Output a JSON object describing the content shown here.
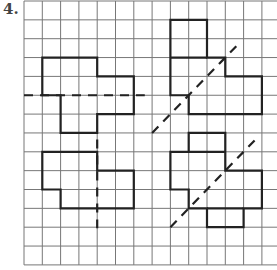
{
  "problem_number": "4.",
  "grid": {
    "origin_x": 24,
    "origin_y": 1,
    "cell_w": 18.3,
    "cell_h": 18.85,
    "cols": 14,
    "rows": 14,
    "line_color": "#777777",
    "outline_color": "#222222"
  },
  "shapes": [
    {
      "name": "shape-top-left",
      "points": [
        [
          1,
          3
        ],
        [
          4,
          3
        ],
        [
          4,
          4
        ],
        [
          6,
          4
        ],
        [
          6,
          6
        ],
        [
          4,
          6
        ],
        [
          4,
          7
        ],
        [
          2,
          7
        ],
        [
          2,
          5
        ],
        [
          1,
          5
        ]
      ],
      "internal": []
    },
    {
      "name": "shape-top-right",
      "points": [
        [
          8,
          1
        ],
        [
          10,
          1
        ],
        [
          10,
          3
        ],
        [
          11,
          3
        ],
        [
          11,
          4
        ],
        [
          13,
          4
        ],
        [
          13,
          6
        ],
        [
          9,
          6
        ],
        [
          9,
          5
        ],
        [
          8,
          5
        ]
      ],
      "internal": [
        [
          [
            8,
            3
          ],
          [
            10,
            3
          ]
        ]
      ]
    },
    {
      "name": "shape-bottom-left",
      "points": [
        [
          1,
          8
        ],
        [
          4,
          8
        ],
        [
          4,
          9
        ],
        [
          6,
          9
        ],
        [
          6,
          11
        ],
        [
          2,
          11
        ],
        [
          2,
          10
        ],
        [
          1,
          10
        ]
      ],
      "internal": []
    },
    {
      "name": "shape-bottom-right",
      "points": [
        [
          8,
          8
        ],
        [
          9,
          8
        ],
        [
          9,
          7
        ],
        [
          11,
          7
        ],
        [
          11,
          9
        ],
        [
          13,
          9
        ],
        [
          13,
          11
        ],
        [
          12,
          11
        ],
        [
          12,
          12
        ],
        [
          10,
          12
        ],
        [
          10,
          11
        ],
        [
          9,
          11
        ],
        [
          9,
          10
        ],
        [
          8,
          10
        ]
      ],
      "internal": [
        [
          [
            9,
            8
          ],
          [
            11,
            8
          ]
        ],
        [
          [
            10,
            11
          ],
          [
            12,
            11
          ]
        ]
      ]
    }
  ],
  "cut_lines": [
    {
      "name": "horizontal-cut-line",
      "from": [
        0,
        5
      ],
      "to": [
        6.6,
        5
      ]
    },
    {
      "name": "diagonal-cut-line-top",
      "from": [
        7,
        7
      ],
      "to": [
        11.6,
        2.4
      ]
    },
    {
      "name": "vertical-cut-line",
      "from": [
        4,
        7.35
      ],
      "to": [
        4,
        12.05
      ]
    },
    {
      "name": "diagonal-cut-line-bottom",
      "from": [
        8,
        12
      ],
      "to": [
        12.6,
        7.4
      ]
    }
  ]
}
